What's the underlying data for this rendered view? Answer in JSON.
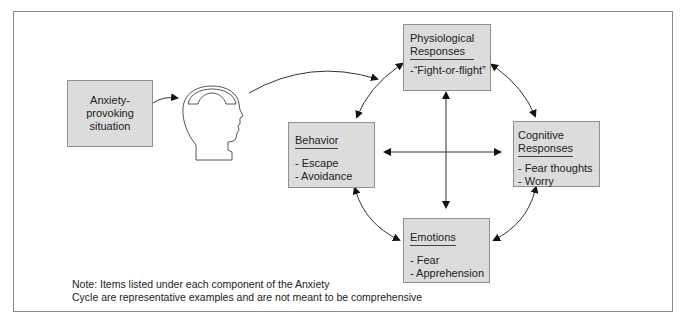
{
  "diagram": {
    "title": "Anxiety Cycle",
    "trigger": {
      "label": "Anxiety-provoking situation",
      "lines": [
        "Anxiety-",
        "provoking",
        "situation"
      ]
    },
    "head_icon": "head-profile-with-brain-icon",
    "components": {
      "physiological": {
        "title_lines": [
          "Physiological",
          "Responses"
        ],
        "items": [
          "-“Fight-or-flight”"
        ]
      },
      "behavior": {
        "title": "Behavior",
        "items": [
          "- Escape",
          "- Avoidance"
        ]
      },
      "cognitive": {
        "title_lines": [
          "Cognitive",
          "Responses"
        ],
        "items": [
          "- Fear thoughts",
          "- Worry"
        ]
      },
      "emotions": {
        "title": "Emotions",
        "items": [
          "- Fear",
          "- Apprehension"
        ]
      }
    },
    "connections": [
      {
        "from": "Anxiety-provoking situation",
        "to": "Head",
        "type": "one-way"
      },
      {
        "from": "Head",
        "to": "Physiological Responses",
        "type": "one-way"
      },
      {
        "from": "Physiological Responses",
        "to": "Behavior",
        "type": "two-way"
      },
      {
        "from": "Physiological Responses",
        "to": "Cognitive Responses",
        "type": "two-way"
      },
      {
        "from": "Behavior",
        "to": "Emotions",
        "type": "two-way"
      },
      {
        "from": "Cognitive Responses",
        "to": "Emotions",
        "type": "two-way"
      },
      {
        "from": "Physiological Responses",
        "to": "Emotions",
        "type": "two-way"
      },
      {
        "from": "Behavior",
        "to": "Cognitive Responses",
        "type": "two-way"
      }
    ],
    "note": {
      "line1": "Note: Items listed under each component of the Anxiety",
      "line2": "Cycle are representative examples and are not meant to be comprehensive"
    },
    "colors": {
      "box_fill": "#dcdcdc",
      "box_border": "#8f8f8f",
      "line": "#333333",
      "frame": "#8a8a8a"
    }
  }
}
